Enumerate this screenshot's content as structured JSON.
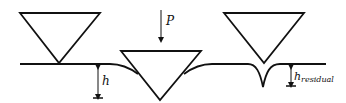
{
  "diagram": {
    "colors": {
      "stroke": "#111111",
      "background": "#ffffff"
    },
    "labels": {
      "depth": "h",
      "load": "P",
      "residual_base": "h",
      "residual_sub": "residual"
    },
    "stages": [
      {
        "name": "before-loading",
        "annotation": "h"
      },
      {
        "name": "under-load",
        "annotation": "P"
      },
      {
        "name": "after-unloading",
        "annotation": "h_residual"
      }
    ]
  }
}
